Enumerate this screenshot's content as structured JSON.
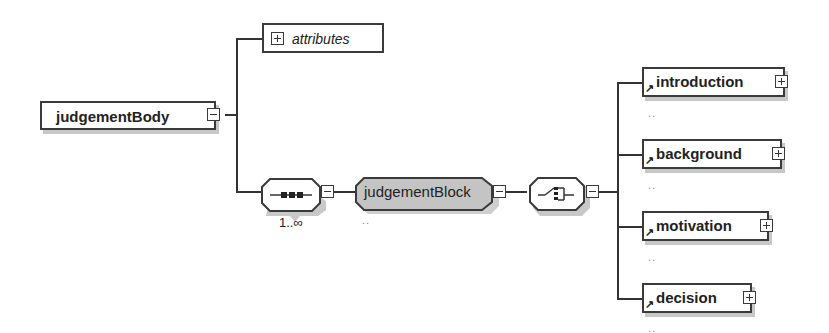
{
  "diagram": {
    "root": {
      "label": "judgementBody",
      "toggle": "collapse"
    },
    "attributes": {
      "label": "attributes",
      "toggle": "expand"
    },
    "sequence": {
      "icon": "sequence-compositor-icon",
      "occurrence": "1..∞",
      "toggle": "collapse"
    },
    "block": {
      "label": "judgementBlock",
      "toggle": "collapse",
      "fill": "#c4c4c4",
      "dots": ".."
    },
    "choice": {
      "icon": "choice-compositor-icon",
      "toggle": "collapse"
    },
    "children": [
      {
        "label": "introduction",
        "toggle": "expand",
        "dots": ".."
      },
      {
        "label": "background",
        "toggle": "expand",
        "dots": ".."
      },
      {
        "label": "motivation",
        "toggle": "expand",
        "dots": ".."
      },
      {
        "label": "decision",
        "toggle": "expand",
        "dots": ".."
      }
    ],
    "colors": {
      "line": "#333333",
      "shadow": "#c8c8c8",
      "block_fill": "#c4c4c4"
    }
  }
}
